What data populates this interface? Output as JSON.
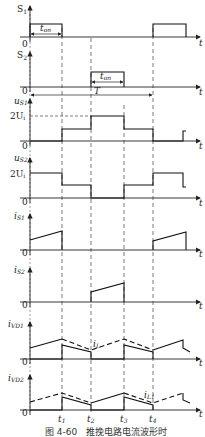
{
  "figure": {
    "caption": "图 4-60　推挽电路电流波形时",
    "x_axis_label": "t",
    "origin_label": "0",
    "time_markers": [
      "t1",
      "t2",
      "t3",
      "t4"
    ],
    "period_label": "T",
    "on_time_label": "ton"
  },
  "panels": [
    {
      "id": "S1",
      "label": "S",
      "sub": "1",
      "desc": "Switch S1 gate signal: on during 0–t1 and t4–end"
    },
    {
      "id": "S2",
      "label": "S",
      "sub": "2",
      "desc": "Switch S2 gate signal: on during t2–t3"
    },
    {
      "id": "uS1",
      "label": "u",
      "sub": "S1",
      "level_label": "2U",
      "level_sub": "i",
      "desc": "S1 voltage: 0, Ui, 2Ui, Ui, 0"
    },
    {
      "id": "uS2",
      "label": "u",
      "sub": "S2",
      "level_label": "2U",
      "level_sub": "i",
      "desc": "S2 voltage: 2Ui, Ui, 0, Ui, 2Ui"
    },
    {
      "id": "iS1",
      "label": "i",
      "sub": "S1",
      "desc": "S1 current ramps during on-time"
    },
    {
      "id": "iS2",
      "label": "i",
      "sub": "S2",
      "desc": "S2 current ramps during on-time"
    },
    {
      "id": "iVD1",
      "label": "i",
      "sub": "VD1",
      "curve_label": "i",
      "curve_sub": "L",
      "desc": "Diode VD1 current with inductor current iL dashed"
    },
    {
      "id": "iVD2",
      "label": "i",
      "sub": "VD2",
      "curve_label": "i",
      "curve_sub": "L1",
      "desc": "Diode VD2 current with inductor current iL1 dashed"
    }
  ],
  "labels": {
    "t1": "t",
    "t1_sub": "1",
    "t2": "t",
    "t2_sub": "2",
    "t3": "t",
    "t3_sub": "3",
    "t4": "t",
    "t4_sub": "4",
    "ton": "t",
    "ton_sub": "on",
    "T": "T",
    "zero": "0",
    "t": "t"
  }
}
